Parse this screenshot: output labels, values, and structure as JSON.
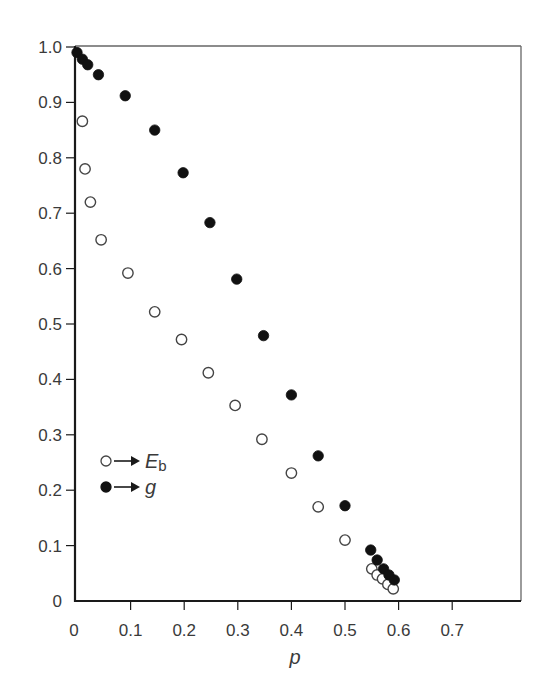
{
  "chart_data": {
    "type": "scatter",
    "title": "",
    "xlabel": "p",
    "ylabel": "",
    "xlim": [
      0,
      0.83
    ],
    "ylim": [
      0,
      1.0
    ],
    "grid": false,
    "x_ticks": [
      0,
      0.1,
      0.2,
      0.3,
      0.4,
      0.5,
      0.6,
      0.7
    ],
    "x_tick_labels": [
      "0",
      "0.1",
      "0.2",
      "0.3",
      "0.4",
      "0.5",
      "0.6",
      "0.7"
    ],
    "y_ticks": [
      0,
      0.1,
      0.2,
      0.3,
      0.4,
      0.5,
      0.6,
      0.7,
      0.8,
      0.9,
      1.0
    ],
    "y_tick_labels": [
      "0",
      "0.1",
      "0.2",
      "0.3",
      "0.4",
      "0.5",
      "0.6",
      "0.7",
      "0.8",
      "0.9",
      "1.0"
    ],
    "legend_position": "lower-left (inside plot)",
    "series": [
      {
        "name": "E_b",
        "legend_label": "E",
        "legend_subscript": "b",
        "marker": "open-circle",
        "points": [
          [
            0.01,
            0.866
          ],
          [
            0.015,
            0.78
          ],
          [
            0.025,
            0.72
          ],
          [
            0.045,
            0.652
          ],
          [
            0.095,
            0.592
          ],
          [
            0.145,
            0.522
          ],
          [
            0.195,
            0.472
          ],
          [
            0.245,
            0.412
          ],
          [
            0.295,
            0.353
          ],
          [
            0.345,
            0.292
          ],
          [
            0.4,
            0.231
          ],
          [
            0.45,
            0.17
          ],
          [
            0.5,
            0.11
          ],
          [
            0.55,
            0.058
          ],
          [
            0.56,
            0.047
          ],
          [
            0.57,
            0.04
          ],
          [
            0.58,
            0.03
          ],
          [
            0.59,
            0.022
          ]
        ]
      },
      {
        "name": "g",
        "legend_label": "g",
        "legend_subscript": "",
        "marker": "filled-circle",
        "points": [
          [
            0.0,
            0.99
          ],
          [
            0.01,
            0.978
          ],
          [
            0.02,
            0.968
          ],
          [
            0.04,
            0.95
          ],
          [
            0.09,
            0.912
          ],
          [
            0.145,
            0.85
          ],
          [
            0.198,
            0.773
          ],
          [
            0.248,
            0.683
          ],
          [
            0.298,
            0.581
          ],
          [
            0.348,
            0.479
          ],
          [
            0.4,
            0.372
          ],
          [
            0.45,
            0.262
          ],
          [
            0.5,
            0.172
          ],
          [
            0.548,
            0.092
          ],
          [
            0.56,
            0.074
          ],
          [
            0.572,
            0.058
          ],
          [
            0.582,
            0.047
          ],
          [
            0.592,
            0.038
          ]
        ]
      }
    ]
  },
  "colors": {
    "axis": "#1a1a1a",
    "frame": "#666666",
    "text": "#3a3a3a",
    "marker_fill": "#111111",
    "marker_open_stroke": "#444444"
  }
}
